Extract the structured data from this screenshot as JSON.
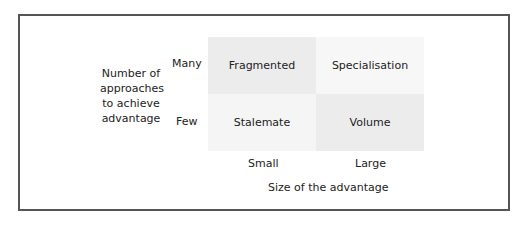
{
  "diagram": {
    "y_axis_label": "Number of approaches to achieve advantage",
    "y_axis_label_lines": [
      "Number of",
      "approaches",
      "to achieve",
      "advantage"
    ],
    "y_ticks": [
      "Many",
      "Few"
    ],
    "x_axis_label": "Size of the advantage",
    "x_ticks": [
      "Small",
      "Large"
    ],
    "cells": {
      "many_small": "Fragmented",
      "many_large": "Specialisation",
      "few_small": "Stalemate",
      "few_large": "Volume"
    },
    "colors": {
      "dark_cell": "#ececec",
      "light_cell": "#f6f6f6",
      "frame": "#555555"
    }
  }
}
